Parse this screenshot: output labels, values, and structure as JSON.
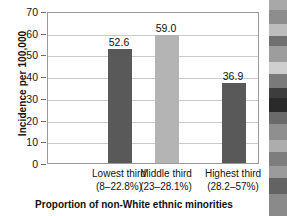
{
  "chart_data": {
    "type": "bar",
    "title": "",
    "xlabel": "Proportion of non-White ethnic minorities",
    "ylabel": "Incidence per 100,000",
    "categories": [
      "Lowest third\n(8–22.8%)",
      "Middle third\n(23–28.1%)",
      "Highest third\n(28.2–57%)"
    ],
    "values": [
      52.6,
      59.0,
      36.9
    ],
    "value_labels": [
      "52.6",
      "59.0",
      "36.9"
    ],
    "ylim": [
      0,
      70
    ],
    "yticks": [
      0,
      10,
      20,
      30,
      40,
      50,
      60,
      70
    ],
    "ytick_labels": [
      "0",
      "10",
      "20",
      "30",
      "40",
      "50",
      "60",
      "70"
    ],
    "grid": true,
    "legend": "none",
    "bar_colors": [
      "#595959",
      "#b4b4b4",
      "#595959"
    ]
  },
  "axes": {
    "y_title": "Incidence per 100,000",
    "x_title": "Proportion of non-White ethnic minorities"
  },
  "categories_lines": [
    {
      "line1": "Lowest third",
      "line2": "(8–22.8%)"
    },
    {
      "line1": "Middle third",
      "line2": "(23–28.1%)"
    },
    {
      "line1": "Highest third",
      "line2": "(28.2–57%)"
    }
  ],
  "colors": {
    "bar_dark": "#595959",
    "bar_light": "#b4b4b4",
    "frame": "#9a9a9a",
    "gridline": "#c9c9c9",
    "text": "#111111"
  },
  "side_image": {
    "name": "photograph-strip",
    "description": "grayscale photograph edge"
  }
}
